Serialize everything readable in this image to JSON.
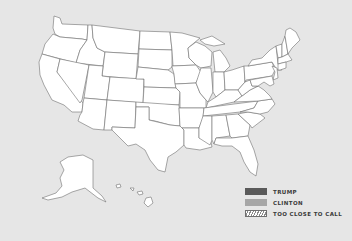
{
  "map": {
    "title": "US Presidential Election Map",
    "fill_color": "#ffffff",
    "border_color": "#6f6f6f",
    "background_color": "#e6e6e6"
  },
  "legend": {
    "items": [
      {
        "label": "TRUMP",
        "color": "#5a5a5a",
        "pattern": "solid"
      },
      {
        "label": "CLINTON",
        "color": "#a6a6a6",
        "pattern": "solid"
      },
      {
        "label": "TOO CLOSE TO CALL",
        "color": "#ffffff",
        "pattern": "hatched"
      }
    ]
  }
}
